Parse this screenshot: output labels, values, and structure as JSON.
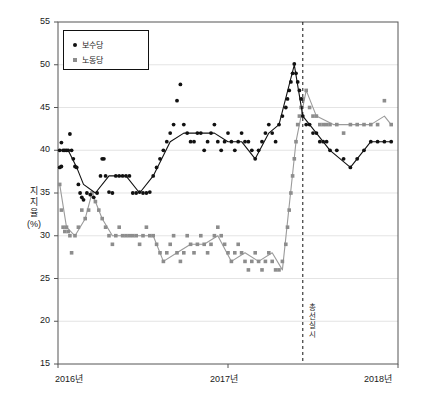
{
  "chart_data": {
    "type": "scatter",
    "title": "",
    "xlabel": "",
    "ylabel": "지지율 (%)",
    "ylabel_lines": [
      "지",
      "지",
      "율",
      "(%)"
    ],
    "ylim": [
      15,
      55
    ],
    "xlim": [
      2016.0,
      2018.0
    ],
    "yticks": [
      15,
      20,
      25,
      30,
      35,
      40,
      45,
      50,
      55
    ],
    "ytick_labels": [
      "15",
      "20",
      "25",
      "30",
      "35",
      "40",
      "45",
      "50",
      "55"
    ],
    "xticks": [
      2016.0,
      2017.0,
      2018.0
    ],
    "xtick_labels": [
      "2016년",
      "2017년",
      "2018년"
    ],
    "grid": "horizontal-light",
    "legend_position": "top-left-inside",
    "legend": [
      {
        "label": "보수당",
        "marker": "circle",
        "color": "#111111"
      },
      {
        "label": "노동당",
        "marker": "square",
        "color": "#8d8d8d"
      }
    ],
    "annotations": [
      {
        "type": "vline",
        "x": 2017.44,
        "style": "dashed",
        "color": "#111111",
        "label": "총선 실시",
        "label_lines": [
          "총",
          "선",
          "실",
          "시"
        ],
        "label_orientation": "vertical"
      }
    ],
    "series": [
      {
        "name": "보수당",
        "marker": "circle",
        "color": "#111111",
        "trendline": true,
        "trendline_color": "#111111",
        "points": [
          [
            2016.01,
            40.0
          ],
          [
            2016.01,
            38.0
          ],
          [
            2016.02,
            40.9
          ],
          [
            2016.02,
            38.1
          ],
          [
            2016.03,
            40.0
          ],
          [
            2016.04,
            40.0
          ],
          [
            2016.05,
            40.0
          ],
          [
            2016.06,
            40.0
          ],
          [
            2016.07,
            41.9
          ],
          [
            2016.08,
            40.0
          ],
          [
            2016.09,
            39.0
          ],
          [
            2016.1,
            38.1
          ],
          [
            2016.11,
            38.0
          ],
          [
            2016.12,
            36.0
          ],
          [
            2016.13,
            35.0
          ],
          [
            2016.14,
            34.5
          ],
          [
            2016.15,
            34.2
          ],
          [
            2016.17,
            35.0
          ],
          [
            2016.19,
            34.8
          ],
          [
            2016.21,
            34.5
          ],
          [
            2016.23,
            35.0
          ],
          [
            2016.25,
            37.0
          ],
          [
            2016.26,
            39.0
          ],
          [
            2016.27,
            39.0
          ],
          [
            2016.28,
            37.0
          ],
          [
            2016.3,
            35.1
          ],
          [
            2016.32,
            35.0
          ],
          [
            2016.34,
            37.0
          ],
          [
            2016.36,
            37.0
          ],
          [
            2016.38,
            37.0
          ],
          [
            2016.4,
            37.0
          ],
          [
            2016.42,
            37.0
          ],
          [
            2016.44,
            35.0
          ],
          [
            2016.46,
            35.0
          ],
          [
            2016.48,
            35.1
          ],
          [
            2016.5,
            35.0
          ],
          [
            2016.52,
            35.0
          ],
          [
            2016.54,
            35.1
          ],
          [
            2016.56,
            37.0
          ],
          [
            2016.58,
            38.0
          ],
          [
            2016.6,
            39.0
          ],
          [
            2016.62,
            40.0
          ],
          [
            2016.64,
            41.0
          ],
          [
            2016.66,
            42.0
          ],
          [
            2016.68,
            43.0
          ],
          [
            2016.7,
            45.8
          ],
          [
            2016.72,
            47.7
          ],
          [
            2016.74,
            43.0
          ],
          [
            2016.76,
            42.0
          ],
          [
            2016.78,
            41.0
          ],
          [
            2016.8,
            41.0
          ],
          [
            2016.82,
            42.0
          ],
          [
            2016.84,
            42.0
          ],
          [
            2016.86,
            40.0
          ],
          [
            2016.88,
            41.0
          ],
          [
            2016.9,
            42.0
          ],
          [
            2016.92,
            43.0
          ],
          [
            2016.94,
            41.0
          ],
          [
            2016.96,
            40.0
          ],
          [
            2016.98,
            41.0
          ],
          [
            2017.0,
            42.0
          ],
          [
            2017.02,
            41.0
          ],
          [
            2017.04,
            40.0
          ],
          [
            2017.06,
            41.0
          ],
          [
            2017.08,
            42.0
          ],
          [
            2017.1,
            41.0
          ],
          [
            2017.12,
            41.0
          ],
          [
            2017.14,
            40.0
          ],
          [
            2017.16,
            39.0
          ],
          [
            2017.18,
            40.0
          ],
          [
            2017.2,
            41.0
          ],
          [
            2017.22,
            42.0
          ],
          [
            2017.24,
            43.0
          ],
          [
            2017.26,
            42.0
          ],
          [
            2017.28,
            41.0
          ],
          [
            2017.3,
            43.0
          ],
          [
            2017.32,
            44.0
          ],
          [
            2017.34,
            45.0
          ],
          [
            2017.35,
            46.0
          ],
          [
            2017.36,
            47.0
          ],
          [
            2017.37,
            48.0
          ],
          [
            2017.38,
            49.0
          ],
          [
            2017.39,
            50.1
          ],
          [
            2017.4,
            49.0
          ],
          [
            2017.41,
            48.0
          ],
          [
            2017.42,
            47.0
          ],
          [
            2017.43,
            46.0
          ],
          [
            2017.44,
            44.0
          ],
          [
            2017.46,
            43.0
          ],
          [
            2017.48,
            43.0
          ],
          [
            2017.5,
            42.0
          ],
          [
            2017.52,
            42.0
          ],
          [
            2017.54,
            41.0
          ],
          [
            2017.56,
            41.0
          ],
          [
            2017.58,
            41.0
          ],
          [
            2017.6,
            40.0
          ],
          [
            2017.64,
            40.0
          ],
          [
            2017.68,
            39.0
          ],
          [
            2017.72,
            38.0
          ],
          [
            2017.76,
            39.0
          ],
          [
            2017.8,
            40.0
          ],
          [
            2017.84,
            41.0
          ],
          [
            2017.88,
            41.0
          ],
          [
            2017.92,
            41.0
          ],
          [
            2017.96,
            41.0
          ]
        ],
        "trend": [
          [
            2016.01,
            40.0
          ],
          [
            2016.06,
            40.0
          ],
          [
            2016.11,
            38.0
          ],
          [
            2016.15,
            36.0
          ],
          [
            2016.22,
            35.0
          ],
          [
            2016.3,
            37.0
          ],
          [
            2016.4,
            37.0
          ],
          [
            2016.48,
            35.0
          ],
          [
            2016.56,
            37.0
          ],
          [
            2016.66,
            41.0
          ],
          [
            2016.74,
            42.0
          ],
          [
            2016.84,
            42.0
          ],
          [
            2016.92,
            42.0
          ],
          [
            2017.0,
            41.0
          ],
          [
            2017.08,
            41.0
          ],
          [
            2017.16,
            39.0
          ],
          [
            2017.24,
            42.0
          ],
          [
            2017.3,
            43.0
          ],
          [
            2017.39,
            50.0
          ],
          [
            2017.44,
            44.0
          ],
          [
            2017.52,
            42.0
          ],
          [
            2017.6,
            40.0
          ],
          [
            2017.72,
            38.0
          ],
          [
            2017.84,
            41.0
          ],
          [
            2017.96,
            41.0
          ]
        ]
      },
      {
        "name": "노동당",
        "marker": "square",
        "color": "#8d8d8d",
        "trendline": true,
        "trendline_color": "#9b9b9b",
        "points": [
          [
            2016.01,
            36.0
          ],
          [
            2016.02,
            33.0
          ],
          [
            2016.03,
            31.0
          ],
          [
            2016.04,
            30.5
          ],
          [
            2016.05,
            31.0
          ],
          [
            2016.06,
            30.5
          ],
          [
            2016.07,
            30.0
          ],
          [
            2016.08,
            28.0
          ],
          [
            2016.1,
            30.0
          ],
          [
            2016.12,
            31.0
          ],
          [
            2016.14,
            33.0
          ],
          [
            2016.16,
            32.0
          ],
          [
            2016.18,
            33.0
          ],
          [
            2016.2,
            35.0
          ],
          [
            2016.22,
            34.0
          ],
          [
            2016.24,
            33.0
          ],
          [
            2016.26,
            32.0
          ],
          [
            2016.28,
            31.0
          ],
          [
            2016.3,
            30.0
          ],
          [
            2016.32,
            29.0
          ],
          [
            2016.34,
            30.0
          ],
          [
            2016.36,
            31.0
          ],
          [
            2016.38,
            30.0
          ],
          [
            2016.4,
            30.0
          ],
          [
            2016.42,
            30.0
          ],
          [
            2016.44,
            30.0
          ],
          [
            2016.46,
            30.0
          ],
          [
            2016.48,
            29.0
          ],
          [
            2016.5,
            30.0
          ],
          [
            2016.52,
            31.0
          ],
          [
            2016.54,
            30.0
          ],
          [
            2016.56,
            30.0
          ],
          [
            2016.58,
            29.0
          ],
          [
            2016.6,
            28.0
          ],
          [
            2016.62,
            27.0
          ],
          [
            2016.64,
            28.0
          ],
          [
            2016.66,
            29.0
          ],
          [
            2016.68,
            30.0
          ],
          [
            2016.7,
            28.0
          ],
          [
            2016.72,
            27.0
          ],
          [
            2016.74,
            28.0
          ],
          [
            2016.76,
            30.0
          ],
          [
            2016.78,
            29.0
          ],
          [
            2016.8,
            28.0
          ],
          [
            2016.82,
            29.0
          ],
          [
            2016.84,
            30.0
          ],
          [
            2016.86,
            29.0
          ],
          [
            2016.88,
            28.0
          ],
          [
            2016.9,
            29.0
          ],
          [
            2016.92,
            30.0
          ],
          [
            2016.94,
            31.0
          ],
          [
            2016.96,
            30.0
          ],
          [
            2016.98,
            29.0
          ],
          [
            2017.0,
            28.0
          ],
          [
            2017.02,
            27.0
          ],
          [
            2017.04,
            28.0
          ],
          [
            2017.06,
            29.0
          ],
          [
            2017.08,
            28.0
          ],
          [
            2017.1,
            27.0
          ],
          [
            2017.12,
            26.0
          ],
          [
            2017.14,
            27.0
          ],
          [
            2017.16,
            28.0
          ],
          [
            2017.18,
            27.0
          ],
          [
            2017.2,
            26.0
          ],
          [
            2017.22,
            27.0
          ],
          [
            2017.24,
            28.0
          ],
          [
            2017.26,
            27.0
          ],
          [
            2017.28,
            26.0
          ],
          [
            2017.3,
            26.0
          ],
          [
            2017.32,
            27.0
          ],
          [
            2017.34,
            29.0
          ],
          [
            2017.35,
            31.0
          ],
          [
            2017.36,
            33.0
          ],
          [
            2017.37,
            35.0
          ],
          [
            2017.38,
            37.0
          ],
          [
            2017.39,
            39.0
          ],
          [
            2017.4,
            41.0
          ],
          [
            2017.41,
            43.0
          ],
          [
            2017.42,
            44.0
          ],
          [
            2017.43,
            45.0
          ],
          [
            2017.44,
            46.0
          ],
          [
            2017.46,
            47.0
          ],
          [
            2017.48,
            45.0
          ],
          [
            2017.5,
            44.0
          ],
          [
            2017.52,
            44.0
          ],
          [
            2017.54,
            43.0
          ],
          [
            2017.56,
            43.0
          ],
          [
            2017.58,
            43.0
          ],
          [
            2017.6,
            43.0
          ],
          [
            2017.64,
            43.0
          ],
          [
            2017.68,
            42.0
          ],
          [
            2017.72,
            43.0
          ],
          [
            2017.76,
            43.0
          ],
          [
            2017.8,
            43.0
          ],
          [
            2017.84,
            43.0
          ],
          [
            2017.88,
            43.0
          ],
          [
            2017.92,
            45.8
          ],
          [
            2017.96,
            43.0
          ]
        ],
        "trend": [
          [
            2016.01,
            36.0
          ],
          [
            2016.05,
            31.0
          ],
          [
            2016.1,
            30.0
          ],
          [
            2016.16,
            32.0
          ],
          [
            2016.2,
            35.0
          ],
          [
            2016.26,
            32.0
          ],
          [
            2016.32,
            30.0
          ],
          [
            2016.4,
            30.0
          ],
          [
            2016.48,
            30.0
          ],
          [
            2016.56,
            30.0
          ],
          [
            2016.62,
            27.0
          ],
          [
            2016.7,
            28.0
          ],
          [
            2016.78,
            29.0
          ],
          [
            2016.86,
            29.0
          ],
          [
            2016.94,
            30.0
          ],
          [
            2017.02,
            27.0
          ],
          [
            2017.1,
            28.0
          ],
          [
            2017.18,
            27.0
          ],
          [
            2017.26,
            28.0
          ],
          [
            2017.32,
            26.0
          ],
          [
            2017.4,
            41.0
          ],
          [
            2017.46,
            47.0
          ],
          [
            2017.52,
            44.0
          ],
          [
            2017.62,
            43.0
          ],
          [
            2017.72,
            43.0
          ],
          [
            2017.84,
            43.0
          ],
          [
            2017.92,
            44.0
          ],
          [
            2017.96,
            43.0
          ]
        ]
      }
    ]
  }
}
